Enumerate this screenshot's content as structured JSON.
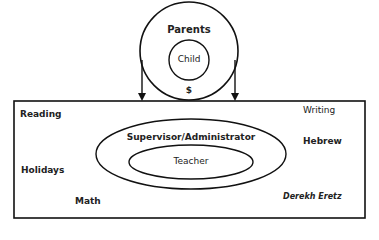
{
  "diagram": {
    "top_group": {
      "outer_label": "Parents",
      "inner_label": "Child",
      "connector_symbol": "$"
    },
    "school_box": {
      "subjects": [
        {
          "label": "Reading"
        },
        {
          "label": "Writing"
        },
        {
          "label": "Hebrew"
        },
        {
          "label": "Holidays"
        },
        {
          "label": "Math"
        },
        {
          "label": "Derekh Eretz"
        }
      ],
      "outer_ellipse_label": "Supervisor/Administrator",
      "inner_ellipse_label": "Teacher"
    },
    "colors": {
      "stroke": "#111111",
      "background": "#ffffff"
    }
  }
}
